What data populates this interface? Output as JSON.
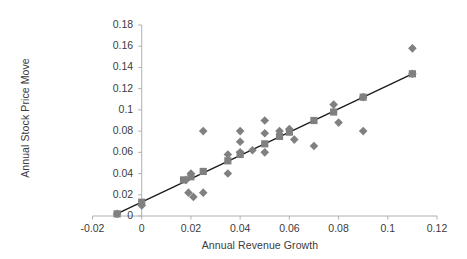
{
  "chart_data": {
    "type": "scatter",
    "title": "",
    "xlabel": "Annual Revenue Growth",
    "ylabel": "Annual Stock Price Move",
    "xlim": [
      -0.02,
      0.12
    ],
    "ylim": [
      0,
      0.18
    ],
    "xticks": [
      -0.02,
      0,
      0.02,
      0.04,
      0.06,
      0.08,
      0.1,
      0.12
    ],
    "xtick_labels": [
      "-0.02",
      "0",
      "0.02",
      "0.04",
      "0.06",
      "0.08",
      "0.1",
      "0.12"
    ],
    "yticks": [
      0,
      0.02,
      0.04,
      0.06,
      0.08,
      0.1,
      0.12,
      0.14,
      0.16,
      0.18
    ],
    "ytick_labels": [
      "0",
      "0.02",
      "0.04",
      "0.06",
      "0.08",
      "0.1",
      "0.12",
      "0.14",
      "0.16",
      "0.18"
    ],
    "grid": false,
    "legend": "none",
    "marker_color": "#808080",
    "trendline_color": "#1a1a1a",
    "axis_color": "#b0b0b0",
    "text_color": "#3b3b3b",
    "series": [
      {
        "name": "Observed",
        "marker": "diamond",
        "color": "#808080",
        "points": [
          {
            "x": -0.01,
            "y": 0.002
          },
          {
            "x": 0.0,
            "y": 0.01
          },
          {
            "x": 0.018,
            "y": 0.034
          },
          {
            "x": 0.019,
            "y": 0.022
          },
          {
            "x": 0.02,
            "y": 0.04
          },
          {
            "x": 0.021,
            "y": 0.018
          },
          {
            "x": 0.025,
            "y": 0.08
          },
          {
            "x": 0.025,
            "y": 0.022
          },
          {
            "x": 0.035,
            "y": 0.058
          },
          {
            "x": 0.035,
            "y": 0.04
          },
          {
            "x": 0.04,
            "y": 0.08
          },
          {
            "x": 0.04,
            "y": 0.07
          },
          {
            "x": 0.04,
            "y": 0.06
          },
          {
            "x": 0.045,
            "y": 0.062
          },
          {
            "x": 0.05,
            "y": 0.09
          },
          {
            "x": 0.05,
            "y": 0.078
          },
          {
            "x": 0.05,
            "y": 0.06
          },
          {
            "x": 0.056,
            "y": 0.08
          },
          {
            "x": 0.06,
            "y": 0.082
          },
          {
            "x": 0.062,
            "y": 0.072
          },
          {
            "x": 0.07,
            "y": 0.066
          },
          {
            "x": 0.078,
            "y": 0.105
          },
          {
            "x": 0.08,
            "y": 0.088
          },
          {
            "x": 0.09,
            "y": 0.08
          },
          {
            "x": 0.09,
            "y": 0.112
          },
          {
            "x": 0.11,
            "y": 0.158
          },
          {
            "x": 0.11,
            "y": 0.134
          }
        ]
      },
      {
        "name": "Fitted",
        "marker": "square",
        "color": "#808080",
        "points": [
          {
            "x": -0.01,
            "y": 0.002
          },
          {
            "x": 0.0,
            "y": 0.013
          },
          {
            "x": 0.017,
            "y": 0.034
          },
          {
            "x": 0.02,
            "y": 0.037
          },
          {
            "x": 0.025,
            "y": 0.042
          },
          {
            "x": 0.035,
            "y": 0.052
          },
          {
            "x": 0.04,
            "y": 0.058
          },
          {
            "x": 0.05,
            "y": 0.068
          },
          {
            "x": 0.056,
            "y": 0.075
          },
          {
            "x": 0.06,
            "y": 0.079
          },
          {
            "x": 0.07,
            "y": 0.09
          },
          {
            "x": 0.078,
            "y": 0.098
          },
          {
            "x": 0.09,
            "y": 0.112
          },
          {
            "x": 0.11,
            "y": 0.134
          }
        ]
      }
    ],
    "trendline": {
      "name": "Linear fit",
      "x_start": -0.011,
      "y_start": 0.001,
      "x_end": 0.11,
      "y_end": 0.134
    }
  }
}
